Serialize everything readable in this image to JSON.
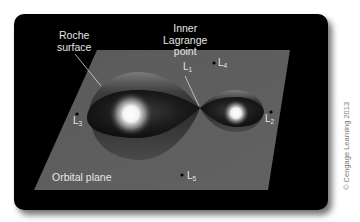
{
  "diagram": {
    "background_color": "#000000",
    "plane_color": "#5c5c5c",
    "labels": {
      "roche_surface": [
        "Roche",
        "surface"
      ],
      "inner_lagrange_point": [
        "Inner",
        "Lagrange",
        "point"
      ],
      "orbital_plane": "Orbital plane"
    },
    "lagrange_points": [
      {
        "id": "L1",
        "letter": "L",
        "sub": "1"
      },
      {
        "id": "L2",
        "letter": "L",
        "sub": "2"
      },
      {
        "id": "L3",
        "letter": "L",
        "sub": "3"
      },
      {
        "id": "L4",
        "letter": "L",
        "sub": "4"
      },
      {
        "id": "L5",
        "letter": "L",
        "sub": "5"
      }
    ],
    "stars": [
      {
        "name": "primary-star",
        "size": "large"
      },
      {
        "name": "secondary-star",
        "size": "small"
      }
    ],
    "copyright": "© Cengage Learning 2013"
  }
}
